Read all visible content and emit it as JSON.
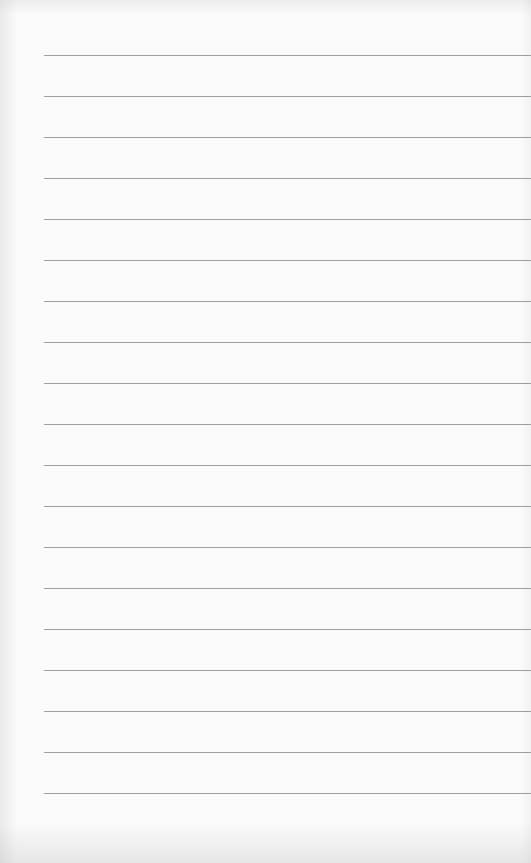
{
  "paper": {
    "type": "lined-paper",
    "background_color": "#fbfbfb",
    "line_color": "#8e8e8e",
    "line_left_margin_px": 44,
    "lines_y_px": [
      55,
      96,
      137,
      178,
      219,
      260,
      301,
      342,
      383,
      424,
      465,
      506,
      547,
      588,
      629,
      670,
      711,
      752,
      793
    ]
  }
}
